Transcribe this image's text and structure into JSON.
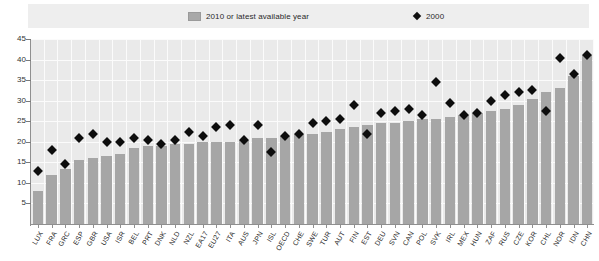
{
  "legend": {
    "bars_label": "2010 or latest available year",
    "diamond_label": "2000",
    "bar_color": "#a6a6a6",
    "diamond_color": "#0d0d0d"
  },
  "chart_data": {
    "type": "bar",
    "title": "",
    "subtitle": "",
    "xlabel": "",
    "ylabel": "",
    "ylim": [
      0,
      45
    ],
    "yticks": [
      5,
      10,
      15,
      20,
      25,
      30,
      35,
      40,
      45
    ],
    "grid": true,
    "legend_position": "top",
    "categories": [
      "LUX",
      "FRA",
      "GRC",
      "ESP",
      "GBR",
      "USA",
      "ISR",
      "BEL",
      "PRT",
      "DNK",
      "NLD",
      "NZL",
      "EA17",
      "EU27",
      "ITA",
      "AUS",
      "JPN",
      "ISL",
      "OECD",
      "CHE",
      "SWE",
      "TUR",
      "AUT",
      "FIN",
      "EST",
      "DEU",
      "SVN",
      "CAN",
      "POL",
      "SVK",
      "IRL",
      "MEX",
      "HUN",
      "ZAF",
      "RUS",
      "CZE",
      "KOR",
      "CHL",
      "NOR",
      "IDN",
      "CHN"
    ],
    "series": [
      {
        "name": "2010 or latest available year",
        "type": "bar",
        "color": "#a6a6a6",
        "values": [
          8.0,
          12.0,
          13.5,
          15.5,
          16.0,
          16.5,
          17.0,
          18.5,
          19.0,
          19.0,
          19.5,
          19.5,
          20.0,
          20.0,
          20.0,
          20.5,
          21.0,
          21.0,
          21.5,
          22.0,
          22.0,
          22.5,
          23.0,
          23.5,
          24.0,
          24.5,
          24.5,
          25.0,
          25.5,
          25.5,
          26.0,
          26.5,
          27.0,
          27.5,
          28.0,
          29.0,
          30.5,
          32.0,
          33.0,
          36.0,
          41.0
        ]
      },
      {
        "name": "2000",
        "type": "scatter",
        "marker": "diamond",
        "color": "#0d0d0d",
        "values": [
          13.0,
          18.0,
          14.5,
          21.0,
          22.0,
          20.0,
          20.0,
          21.0,
          20.5,
          19.5,
          20.5,
          22.5,
          21.5,
          23.5,
          24.0,
          20.5,
          24.0,
          17.5,
          21.5,
          22.0,
          24.5,
          25.0,
          25.5,
          29.0,
          22.0,
          27.0,
          27.5,
          28.0,
          26.5,
          34.5,
          29.5,
          26.5,
          27.0,
          30.0,
          31.5,
          32.0,
          32.5,
          27.5,
          40.5,
          36.5,
          41.0
        ]
      }
    ]
  }
}
